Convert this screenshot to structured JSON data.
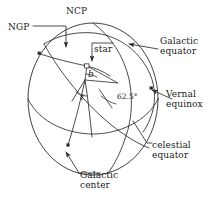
{
  "figure": {
    "name": "celestial-galactic-coordinate-sphere",
    "stroke_color": "#2b2b2b",
    "background_color": "#ffffff"
  },
  "labels": {
    "ncp": "NCP",
    "ngp": "NGP",
    "star": "star",
    "galactic_equator": "Galactic\nequator",
    "vernal_equinox": "Vernal\nequinox",
    "celestial_equator": "celestial\nequator",
    "galactic_center": "Galactic\ncenter",
    "galactic_latitude": "b",
    "galactic_longitude": "ℓ",
    "inclination_angle": "62.5°"
  },
  "points": {
    "ngp_marker": "north-galactic-pole-point",
    "star_marker": "star-point",
    "vernal_equinox_marker": "vernal-equinox-point",
    "galactic_center_marker": "galactic-center-point"
  },
  "values": {
    "inclination_degrees": 62.5
  }
}
